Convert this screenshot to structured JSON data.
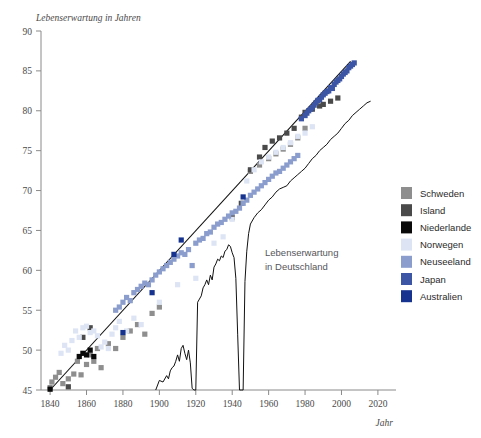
{
  "top_caption": "",
  "axes": {
    "y_title": "Lebenserwartung in Jahren",
    "x_title": "Jahr",
    "y_ticks": [
      "90",
      "85",
      "80",
      "75",
      "70",
      "65",
      "60",
      "55",
      "50",
      "45"
    ],
    "x_ticks": [
      "1840",
      "1860",
      "1880",
      "1900",
      "1920",
      "1940",
      "1960",
      "1980",
      "2000",
      "2020"
    ]
  },
  "annotation": {
    "line1": "Lebenserwartung",
    "line2": "in Deutschland"
  },
  "legend": {
    "items": [
      {
        "label": "Schweden",
        "color": "#8e8e8e"
      },
      {
        "label": "Island",
        "color": "#4a4a4a"
      },
      {
        "label": "Niederlande",
        "color": "#0a0a0a"
      },
      {
        "label": "Norwegen",
        "color": "#dde4f4"
      },
      {
        "label": "Neuseeland",
        "color": "#8b9dcd"
      },
      {
        "label": "Japan",
        "color": "#3c56a5"
      },
      {
        "label": "Australien",
        "color": "#16348f"
      }
    ]
  },
  "chart_data": {
    "type": "scatter",
    "title": "",
    "xlabel": "Jahr",
    "ylabel": "Lebenserwartung in Jahren",
    "xlim": [
      1835,
      2025
    ],
    "ylim": [
      45,
      90
    ],
    "grid": false,
    "legend_position": "right",
    "series": [
      {
        "name": "Schweden",
        "color": "#8e8e8e",
        "points": [
          [
            1840,
            45.3
          ],
          [
            1841,
            46.0
          ],
          [
            1843,
            46.6
          ],
          [
            1845,
            47.2
          ],
          [
            1847,
            45.8
          ],
          [
            1850,
            46.4
          ],
          [
            1853,
            47.0
          ],
          [
            1855,
            48.6
          ],
          [
            1857,
            46.9
          ],
          [
            1860,
            48.2
          ],
          [
            1862,
            49.4
          ],
          [
            1864,
            48.6
          ],
          [
            1866,
            50.2
          ],
          [
            1868,
            47.8
          ],
          [
            1872,
            50.8
          ],
          [
            1876,
            50.2
          ],
          [
            1880,
            51.6
          ],
          [
            1884,
            52.4
          ],
          [
            1888,
            53.2
          ],
          [
            1892,
            52.0
          ],
          [
            1896,
            54.6
          ],
          [
            1900,
            55.4
          ],
          [
            1950,
            72.4
          ],
          [
            1955,
            73.2
          ],
          [
            1960,
            74.0
          ],
          [
            1964,
            74.6
          ],
          [
            1968,
            75.2
          ],
          [
            1972,
            75.8
          ],
          [
            1976,
            76.6
          ],
          [
            1980,
            77.8
          ]
        ]
      },
      {
        "name": "Island",
        "color": "#4a4a4a",
        "points": [
          [
            1850,
            45.4
          ],
          [
            1858,
            51.6
          ],
          [
            1862,
            52.8
          ],
          [
            1940,
            66.6
          ],
          [
            1945,
            68.4
          ],
          [
            1950,
            72.6
          ],
          [
            1955,
            74.2
          ],
          [
            1958,
            75.4
          ],
          [
            1962,
            76.2
          ],
          [
            1966,
            76.6
          ],
          [
            1970,
            77.2
          ],
          [
            1974,
            77.8
          ],
          [
            1978,
            79.2
          ],
          [
            1980,
            79.8
          ],
          [
            1984,
            80.2
          ],
          [
            1988,
            80.6
          ],
          [
            1990,
            80.8
          ],
          [
            1994,
            81.2
          ],
          [
            1998,
            81.6
          ]
        ]
      },
      {
        "name": "Niederlande",
        "color": "#0a0a0a",
        "points": [
          [
            1840,
            45.1
          ],
          [
            1856,
            49.2
          ],
          [
            1858,
            49.6
          ],
          [
            1860,
            49.4
          ],
          [
            1862,
            50.0
          ],
          [
            1864,
            49.2
          ]
        ]
      },
      {
        "name": "Norwegen",
        "color": "#dde4f4",
        "points": [
          [
            1846,
            49.6
          ],
          [
            1848,
            50.6
          ],
          [
            1850,
            50.0
          ],
          [
            1852,
            51.2
          ],
          [
            1854,
            52.4
          ],
          [
            1856,
            51.6
          ],
          [
            1858,
            52.8
          ],
          [
            1860,
            53.0
          ],
          [
            1862,
            52.2
          ],
          [
            1864,
            52.4
          ],
          [
            1866,
            51.8
          ],
          [
            1868,
            50.4
          ],
          [
            1870,
            51.0
          ],
          [
            1872,
            50.2
          ],
          [
            1874,
            52.0
          ],
          [
            1876,
            52.8
          ],
          [
            1878,
            53.6
          ],
          [
            1882,
            52.4
          ],
          [
            1886,
            54.0
          ],
          [
            1890,
            53.2
          ],
          [
            1900,
            56.0
          ],
          [
            1910,
            58.2
          ],
          [
            1920,
            59.0
          ],
          [
            1930,
            63.4
          ],
          [
            1935,
            64.2
          ],
          [
            1940,
            66.4
          ],
          [
            1948,
            71.2
          ],
          [
            1952,
            72.6
          ],
          [
            1956,
            73.6
          ],
          [
            1960,
            74.2
          ],
          [
            1964,
            74.8
          ],
          [
            1968,
            75.4
          ],
          [
            1972,
            76.0
          ],
          [
            1976,
            76.8
          ],
          [
            1980,
            77.2
          ],
          [
            1984,
            78.0
          ]
        ]
      },
      {
        "name": "Neuseeland",
        "color": "#8b9dcd",
        "points": [
          [
            1876,
            55.0
          ],
          [
            1878,
            55.4
          ],
          [
            1880,
            56.0
          ],
          [
            1882,
            56.6
          ],
          [
            1884,
            56.2
          ],
          [
            1886,
            57.2
          ],
          [
            1888,
            57.6
          ],
          [
            1890,
            58.0
          ],
          [
            1892,
            58.4
          ],
          [
            1894,
            58.2
          ],
          [
            1896,
            58.8
          ],
          [
            1898,
            59.4
          ],
          [
            1900,
            59.8
          ],
          [
            1902,
            60.2
          ],
          [
            1904,
            60.6
          ],
          [
            1906,
            61.0
          ],
          [
            1908,
            61.4
          ],
          [
            1910,
            61.8
          ],
          [
            1912,
            62.2
          ],
          [
            1914,
            62.0
          ],
          [
            1916,
            62.6
          ],
          [
            1918,
            60.6
          ],
          [
            1920,
            63.4
          ],
          [
            1922,
            63.8
          ],
          [
            1924,
            64.0
          ],
          [
            1926,
            64.6
          ],
          [
            1928,
            64.8
          ],
          [
            1930,
            65.4
          ],
          [
            1932,
            65.8
          ],
          [
            1934,
            66.0
          ],
          [
            1936,
            66.4
          ],
          [
            1938,
            66.8
          ],
          [
            1940,
            67.2
          ],
          [
            1942,
            67.4
          ],
          [
            1944,
            67.8
          ],
          [
            1946,
            68.4
          ],
          [
            1948,
            68.8
          ],
          [
            1950,
            69.4
          ],
          [
            1952,
            69.8
          ],
          [
            1954,
            70.2
          ],
          [
            1956,
            70.6
          ],
          [
            1958,
            71.0
          ],
          [
            1960,
            71.4
          ],
          [
            1962,
            71.8
          ],
          [
            1964,
            72.2
          ],
          [
            1966,
            72.4
          ],
          [
            1968,
            72.8
          ],
          [
            1970,
            73.2
          ],
          [
            1972,
            73.6
          ],
          [
            1974,
            74.0
          ],
          [
            1976,
            74.4
          ]
        ]
      },
      {
        "name": "Japan",
        "color": "#3c56a5",
        "points": [
          [
            1978,
            79.0
          ],
          [
            1980,
            79.4
          ],
          [
            1981,
            79.7
          ],
          [
            1982,
            80.0
          ],
          [
            1983,
            80.2
          ],
          [
            1984,
            80.4
          ],
          [
            1985,
            80.7
          ],
          [
            1986,
            81.0
          ],
          [
            1987,
            81.3
          ],
          [
            1988,
            81.4
          ],
          [
            1989,
            81.7
          ],
          [
            1990,
            82.0
          ],
          [
            1991,
            82.2
          ],
          [
            1992,
            82.4
          ],
          [
            1993,
            82.5
          ],
          [
            1994,
            82.9
          ],
          [
            1995,
            82.8
          ],
          [
            1996,
            83.3
          ],
          [
            1997,
            83.6
          ],
          [
            1998,
            83.8
          ],
          [
            1999,
            84.0
          ],
          [
            2000,
            84.3
          ],
          [
            2001,
            84.6
          ],
          [
            2002,
            84.8
          ],
          [
            2003,
            85.0
          ],
          [
            2004,
            85.4
          ],
          [
            2005,
            85.6
          ],
          [
            2006,
            85.8
          ],
          [
            2007,
            86.0
          ]
        ]
      },
      {
        "name": "Australien",
        "color": "#16348f",
        "points": [
          [
            1880,
            52.2
          ],
          [
            1896,
            57.2
          ],
          [
            1908,
            62.0
          ],
          [
            1912,
            63.8
          ],
          [
            1946,
            69.2
          ]
        ]
      }
    ],
    "trend_line": {
      "name": "Rekord-Lebenserwartung Trendlinie",
      "start": [
        1840,
        45.0
      ],
      "end": [
        2005,
        86.2
      ],
      "slope_years_per_decade": 2.5
    },
    "germany_line": {
      "name": "Lebenserwartung in Deutschland",
      "color": "#111111",
      "points": [
        [
          1898,
          45.0
        ],
        [
          1900,
          46.2
        ],
        [
          1902,
          46.0
        ],
        [
          1904,
          46.8
        ],
        [
          1905,
          46.4
        ],
        [
          1906,
          47.4
        ],
        [
          1907,
          47.8
        ],
        [
          1908,
          48.0
        ],
        [
          1909,
          48.6
        ],
        [
          1910,
          49.4
        ],
        [
          1911,
          48.6
        ],
        [
          1912,
          50.2
        ],
        [
          1913,
          50.6
        ],
        [
          1914,
          49.6
        ],
        [
          1915,
          48.8
        ],
        [
          1916,
          50.0
        ],
        [
          1917,
          48.4
        ],
        [
          1918,
          45.2
        ],
        [
          1919,
          45.0
        ],
        [
          1920,
          45.0
        ],
        [
          1921,
          56.0
        ],
        [
          1922,
          56.4
        ],
        [
          1923,
          56.8
        ],
        [
          1924,
          57.8
        ],
        [
          1925,
          58.2
        ],
        [
          1926,
          58.8
        ],
        [
          1927,
          58.2
        ],
        [
          1928,
          59.4
        ],
        [
          1929,
          58.8
        ],
        [
          1930,
          60.4
        ],
        [
          1931,
          60.8
        ],
        [
          1932,
          61.4
        ],
        [
          1933,
          61.2
        ],
        [
          1934,
          61.8
        ],
        [
          1935,
          61.6
        ],
        [
          1936,
          62.4
        ],
        [
          1937,
          62.6
        ],
        [
          1938,
          63.2
        ],
        [
          1939,
          63.0
        ],
        [
          1940,
          62.2
        ],
        [
          1941,
          61.6
        ],
        [
          1942,
          59.0
        ],
        [
          1943,
          52.0
        ],
        [
          1944,
          45.0
        ],
        [
          1945,
          45.0
        ],
        [
          1946,
          45.0
        ],
        [
          1947,
          58.6
        ],
        [
          1948,
          62.4
        ],
        [
          1949,
          64.6
        ],
        [
          1950,
          65.8
        ],
        [
          1952,
          66.6
        ],
        [
          1954,
          67.2
        ],
        [
          1956,
          67.6
        ],
        [
          1958,
          68.2
        ],
        [
          1960,
          68.8
        ],
        [
          1962,
          69.2
        ],
        [
          1964,
          69.8
        ],
        [
          1966,
          70.2
        ],
        [
          1968,
          70.4
        ],
        [
          1970,
          70.6
        ],
        [
          1972,
          71.2
        ],
        [
          1974,
          71.6
        ],
        [
          1976,
          72.0
        ],
        [
          1978,
          72.4
        ],
        [
          1980,
          72.8
        ],
        [
          1982,
          73.4
        ],
        [
          1984,
          74.0
        ],
        [
          1986,
          74.4
        ],
        [
          1988,
          75.0
        ],
        [
          1990,
          75.4
        ],
        [
          1992,
          75.8
        ],
        [
          1994,
          76.4
        ],
        [
          1996,
          76.8
        ],
        [
          1998,
          77.2
        ],
        [
          2000,
          77.8
        ],
        [
          2002,
          78.4
        ],
        [
          2004,
          78.8
        ],
        [
          2006,
          79.4
        ],
        [
          2008,
          79.8
        ],
        [
          2010,
          80.2
        ],
        [
          2012,
          80.6
        ],
        [
          2014,
          81.0
        ],
        [
          2016,
          81.2
        ]
      ]
    }
  }
}
